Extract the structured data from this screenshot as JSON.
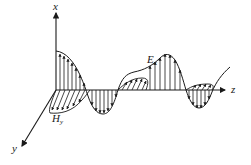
{
  "diagram": {
    "axes": {
      "x_label": "x",
      "y_label": "y",
      "z_label": "z"
    },
    "fields": {
      "electric": {
        "symbol": "E",
        "subscript": "x",
        "plane": "xz",
        "amplitude_decaying": true
      },
      "magnetic": {
        "symbol": "H",
        "subscript": "y",
        "plane": "yz",
        "amplitude_decaying": true
      }
    },
    "colors": {
      "ink": "#1a1a1a",
      "background": "#ffffff"
    }
  }
}
